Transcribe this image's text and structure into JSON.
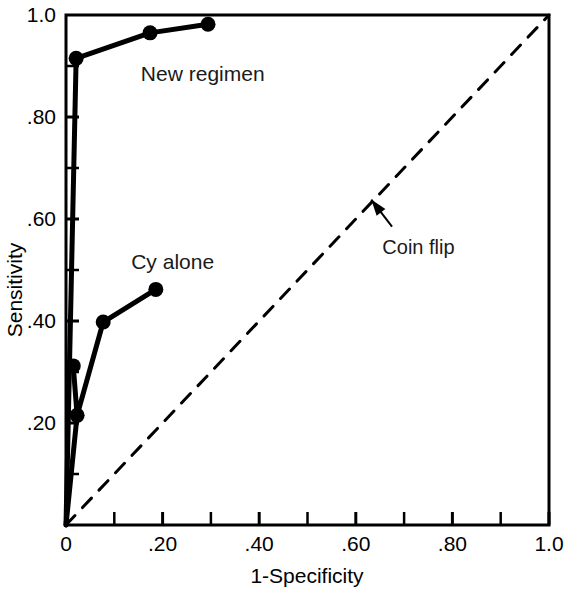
{
  "chart_data": {
    "type": "line",
    "title": "",
    "subtitle": "",
    "xlabel": "1-Specificity",
    "ylabel": "Sensitivity",
    "xlim": [
      0,
      1.0
    ],
    "ylim": [
      0,
      1.0
    ],
    "grid": false,
    "legend_position": "inline-annotations",
    "x_tick_labels": [
      "0",
      ".20",
      ".40",
      ".60",
      ".80",
      "1.0"
    ],
    "x_tick_values": [
      0,
      0.2,
      0.4,
      0.6,
      0.8,
      1.0
    ],
    "x_minor_tick_values": [
      0.1,
      0.3,
      0.5,
      0.7,
      0.9
    ],
    "y_tick_labels": [
      "1.0",
      ".80",
      ".60",
      ".40",
      ".20"
    ],
    "y_tick_values": [
      1.0,
      0.8,
      0.6,
      0.4,
      0.2
    ],
    "y_minor_tick_values": [
      0.9,
      0.7,
      0.5,
      0.3,
      0.1
    ],
    "series": [
      {
        "name": "New regimen",
        "style": "solid-with-markers",
        "color": "#000000",
        "points": [
          {
            "x": 0.0,
            "y": 0.0
          },
          {
            "x": 0.021,
            "y": 0.915
          },
          {
            "x": 0.174,
            "y": 0.965
          },
          {
            "x": 0.294,
            "y": 0.982
          }
        ],
        "marker_points": [
          {
            "x": 0.021,
            "y": 0.915
          },
          {
            "x": 0.174,
            "y": 0.965
          },
          {
            "x": 0.294,
            "y": 0.982
          }
        ]
      },
      {
        "name": "Cy alone",
        "style": "solid-with-markers",
        "color": "#000000",
        "points": [
          {
            "x": 0.0,
            "y": 0.0
          },
          {
            "x": 0.023,
            "y": 0.215
          },
          {
            "x": 0.015,
            "y": 0.312
          },
          {
            "x": 0.023,
            "y": 0.215
          },
          {
            "x": 0.077,
            "y": 0.398
          },
          {
            "x": 0.186,
            "y": 0.462
          }
        ],
        "marker_points": [
          {
            "x": 0.015,
            "y": 0.312
          },
          {
            "x": 0.023,
            "y": 0.215
          },
          {
            "x": 0.077,
            "y": 0.398
          },
          {
            "x": 0.186,
            "y": 0.462
          }
        ]
      },
      {
        "name": "Coin flip",
        "style": "dashed",
        "color": "#000000",
        "points": [
          {
            "x": 0.0,
            "y": 0.0
          },
          {
            "x": 1.0,
            "y": 1.0
          }
        ],
        "marker_points": []
      }
    ],
    "annotations": [
      {
        "text": "New regimen",
        "x": 0.155,
        "y": 0.885,
        "anchor": "start",
        "has_arrow": false
      },
      {
        "text": "Cy alone",
        "x": 0.135,
        "y": 0.515,
        "anchor": "start",
        "has_arrow": false
      },
      {
        "text": "Coin flip",
        "x": 0.655,
        "y": 0.545,
        "anchor": "start",
        "has_arrow": true,
        "arrow_from": {
          "x": 0.675,
          "y": 0.585
        },
        "arrow_to": {
          "x": 0.632,
          "y": 0.638
        }
      }
    ]
  },
  "axes": {
    "x_axis_title": "1-Specificity",
    "y_axis_title": "Sensitivity"
  }
}
